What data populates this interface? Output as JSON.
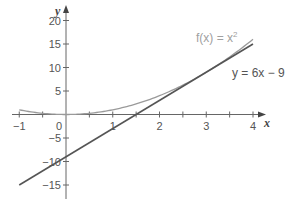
{
  "chart_data": {
    "type": "line",
    "title": "",
    "xlabel": "x",
    "ylabel": "y",
    "xlim": [
      -1.1,
      4.3
    ],
    "ylim": [
      -18,
      23
    ],
    "grid": false,
    "x_ticks": [
      -1,
      -0.5,
      0,
      0.5,
      1,
      1.5,
      2,
      2.5,
      3,
      3.5,
      4
    ],
    "x_tick_labels": [
      {
        "value": -1,
        "label": "−1"
      },
      {
        "value": 0,
        "label": "0"
      },
      {
        "value": 1,
        "label": "1"
      },
      {
        "value": 2,
        "label": "2"
      },
      {
        "value": 3,
        "label": "3"
      },
      {
        "value": 4,
        "label": "4"
      }
    ],
    "y_ticks": [
      -15,
      -10,
      -5,
      5,
      10,
      15,
      20
    ],
    "y_tick_labels": [
      {
        "value": 20,
        "label": "20"
      },
      {
        "value": 15,
        "label": "15"
      },
      {
        "value": 10,
        "label": "10"
      },
      {
        "value": 5,
        "label": "5"
      },
      {
        "value": -5,
        "label": "−5"
      },
      {
        "value": -10,
        "label": "−10"
      },
      {
        "value": -15,
        "label": "−15"
      }
    ],
    "series": [
      {
        "name": "f(x) = x²",
        "expression": "x^2",
        "color": "#9a9a9a",
        "x": [
          -1,
          -0.5,
          0,
          0.5,
          1,
          1.5,
          2,
          2.5,
          3,
          3.5,
          4
        ],
        "values": [
          1,
          0.25,
          0,
          0.25,
          1,
          2.25,
          4,
          6.25,
          9,
          12.25,
          16
        ]
      },
      {
        "name": "y = 6x − 9",
        "expression": "6x - 9",
        "color": "#555555",
        "x": [
          -1,
          4
        ],
        "values": [
          -15,
          15
        ]
      }
    ],
    "annotations": [
      {
        "text": "f(x) = x²",
        "x": 2.8,
        "y": 16.5
      },
      {
        "text": "y = 6x − 9",
        "x": 3.6,
        "y": 9
      }
    ]
  },
  "labels": {
    "x_axis": "x",
    "y_axis": "y",
    "curve": "f(x) = x",
    "curve_exp": "2",
    "tangent": "y = 6x − 9"
  }
}
